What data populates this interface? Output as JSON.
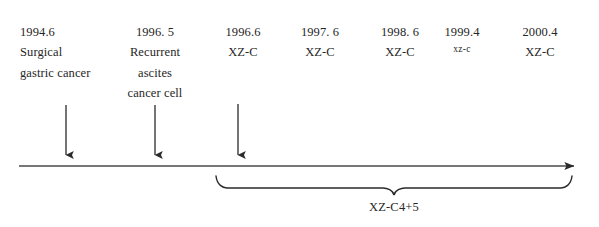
{
  "figure": {
    "type": "timeline-diagram",
    "background_color": "#ffffff",
    "ink_color": "#2a2a2a"
  },
  "events": [
    {
      "date": "1994.6",
      "lines": [
        "Surgical",
        "gastric cancer"
      ],
      "align": "left",
      "x": 20,
      "has_marker_arrow": true,
      "marker_x": 66
    },
    {
      "date": "1996. 5",
      "lines": [
        "Recurrent",
        "ascites",
        "cancer cell"
      ],
      "align": "center",
      "x": 155,
      "has_marker_arrow": true,
      "marker_x": 155
    },
    {
      "date": "1996.6",
      "lines": [
        "XZ-C"
      ],
      "align": "center",
      "x": 243,
      "has_marker_arrow": true,
      "marker_x": 238
    },
    {
      "date": "1997. 6",
      "lines": [
        "XZ-C"
      ],
      "align": "center",
      "x": 320,
      "has_marker_arrow": false
    },
    {
      "date": "1998. 6",
      "lines": [
        "XZ-C"
      ],
      "align": "center",
      "x": 400,
      "has_marker_arrow": false
    },
    {
      "date": "1999.4",
      "lines": [
        "xz-c"
      ],
      "lines_small": true,
      "align": "center",
      "x": 462,
      "has_marker_arrow": false
    },
    {
      "date": "2000.4",
      "lines": [
        "XZ-C"
      ],
      "align": "center",
      "x": 540,
      "has_marker_arrow": false
    }
  ],
  "timeline_axis": {
    "start_x": 19,
    "end_x": 583,
    "y": 166,
    "direction": "left-to-right",
    "arrowhead": "right"
  },
  "brace": {
    "label": "XZ-C4+5",
    "start_x": 216,
    "end_x": 572,
    "tip_x": 394,
    "top_y": 176,
    "label_x": 394,
    "label_y": 200
  }
}
